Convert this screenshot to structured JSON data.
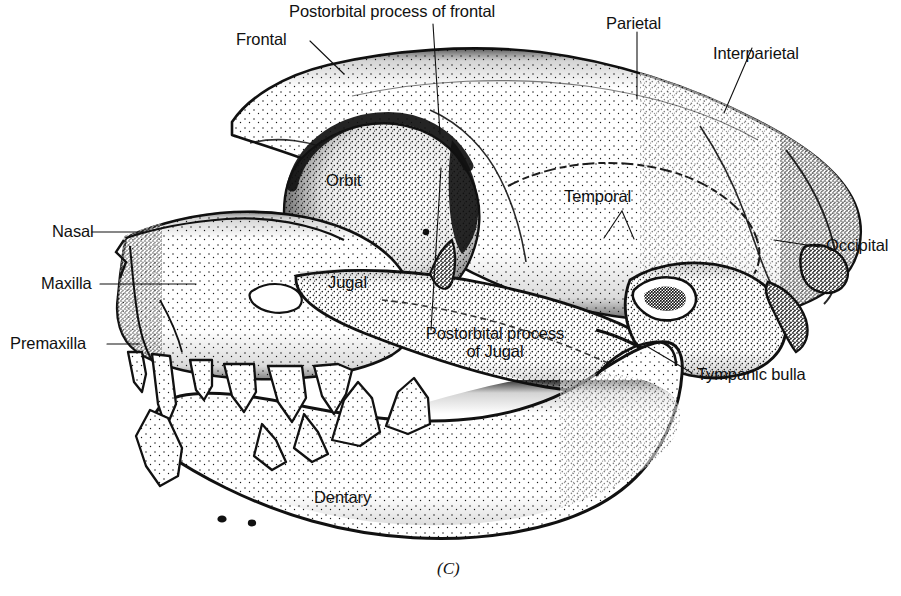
{
  "figure": {
    "caption": "(C)"
  },
  "labels": {
    "frontal": "Frontal",
    "postorbital_process_of_frontal": "Postorbital process of frontal",
    "parietal": "Parietal",
    "interparietal": "Interparietal",
    "occipital": "Occipital",
    "temporal": "Temporal",
    "orbit": "Orbit",
    "jugal": "Jugal",
    "nasal": "Nasal",
    "maxilla": "Maxilla",
    "premaxilla": "Premaxilla",
    "postorbital_process_of_jugal_line1": "Postorbital process",
    "postorbital_process_of_jugal_line2": "of Jugal",
    "tympanic_bulla": "Tympanic bulla",
    "dentary": "Dentary"
  },
  "colors": {
    "ink": "#111111",
    "paper": "#ffffff",
    "stipple": "#1a1a1a"
  }
}
